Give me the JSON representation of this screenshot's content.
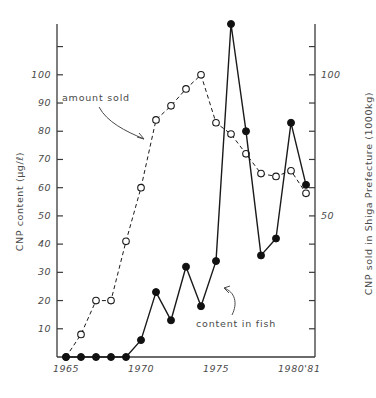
{
  "figure": {
    "left_axis": {
      "title": "CNP content (µg/ℓ)",
      "ticks": [
        10,
        20,
        30,
        40,
        50,
        60,
        70,
        80,
        90,
        100
      ],
      "labels": [
        "10",
        "20",
        "30",
        "40",
        "50",
        "60",
        "70",
        "80",
        "90",
        "100"
      ],
      "range": [
        0,
        118
      ]
    },
    "right_axis": {
      "title": "CNP sold in Shiga Prefecture (1000kg)",
      "ticks": [
        10,
        20,
        30,
        40,
        50,
        60,
        70,
        80,
        90,
        100
      ],
      "labels_shown": [
        "50",
        "100"
      ],
      "range": [
        0,
        118
      ]
    },
    "x_axis": {
      "labels": [
        "1965",
        "1970",
        "1975",
        "1980'81"
      ],
      "label_years": [
        1965,
        1970,
        1975,
        1980
      ],
      "range": [
        1964.4,
        1981.6
      ]
    },
    "annotations": [
      {
        "name": "amount-sold",
        "text": "amount sold"
      },
      {
        "name": "content-in-fish",
        "text": "content in fish"
      }
    ]
  },
  "chart_data": {
    "type": "line",
    "title": "",
    "xlabel": "",
    "ylabel": "CNP content (µg/ℓ)",
    "ylabel_right": "CNP sold in Shiga Prefecture (1000kg)",
    "xlim": [
      1964.4,
      1981.6
    ],
    "ylim": [
      0,
      118
    ],
    "grid": false,
    "legend": "annotations",
    "x": [
      1965,
      1966,
      1967,
      1968,
      1969,
      1970,
      1971,
      1972,
      1973,
      1974,
      1975,
      1976,
      1977,
      1978,
      1979,
      1980,
      1981
    ],
    "series": [
      {
        "name": "amount sold",
        "marker": "open-circle",
        "linestyle": "dashed",
        "axis": "right",
        "x": [
          1965,
          1966,
          1967,
          1968,
          1969,
          1970,
          1971,
          1972,
          1973,
          1974,
          1975,
          1976,
          1977,
          1978,
          1979,
          1980,
          1981
        ],
        "values": [
          0,
          8,
          20,
          20,
          41,
          60,
          84,
          89,
          95,
          100,
          83,
          79,
          72,
          65,
          64,
          66,
          58
        ]
      },
      {
        "name": "content in fish",
        "marker": "filled-circle",
        "linestyle": "solid",
        "axis": "left",
        "x": [
          1965,
          1966,
          1967,
          1968,
          1969,
          1970,
          1971,
          1972,
          1973,
          1974,
          1975,
          1976,
          1977,
          1978,
          1979,
          1980,
          1981
        ],
        "values": [
          0,
          0,
          0,
          0,
          0,
          6,
          23,
          13,
          32,
          18,
          34,
          118,
          80,
          36,
          42,
          83,
          61
        ]
      }
    ]
  }
}
